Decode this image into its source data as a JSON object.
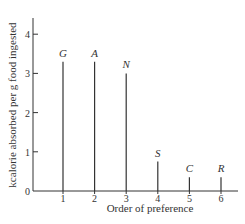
{
  "chart_data": {
    "type": "bar",
    "style": "stem",
    "title": "",
    "xlabel": "Order of preference",
    "ylabel": "kcalorie absorbed per g food ingested",
    "categories": [
      "1",
      "2",
      "3",
      "4",
      "5",
      "6"
    ],
    "point_labels": [
      "G",
      "A",
      "N",
      "S",
      "C",
      "R"
    ],
    "values": [
      3.3,
      3.3,
      3.0,
      0.75,
      0.35,
      0.35
    ],
    "ylim": [
      0,
      4.4
    ],
    "yticks": [
      "0",
      "1",
      "2",
      "3",
      "4"
    ],
    "xticks": [
      "1",
      "2",
      "3",
      "4",
      "5",
      "6"
    ],
    "grid": false,
    "legend": null
  }
}
